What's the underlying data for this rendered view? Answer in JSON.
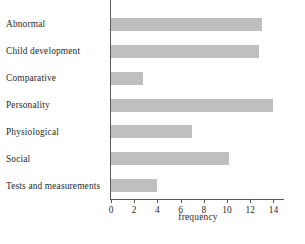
{
  "chart_data": {
    "type": "bar",
    "orientation": "horizontal",
    "title": "",
    "xlabel": "frequency",
    "ylabel": "",
    "categories": [
      "Abnormal",
      "Child development",
      "Comparative",
      "Personality",
      "Physiological",
      "Social",
      "Tests and measurements"
    ],
    "values": [
      13,
      12.8,
      2.8,
      14,
      7,
      10.2,
      4
    ],
    "xlim": [
      0,
      15
    ],
    "xticks": [
      0,
      2,
      4,
      6,
      8,
      10,
      12,
      14
    ],
    "xtick_labels": [
      "0",
      "2",
      "4",
      "6",
      "8",
      "10",
      "12",
      "14"
    ],
    "grid": false,
    "legend": null,
    "bar_color": "#bfbfbf",
    "axis_color": "#5a5a5a"
  }
}
